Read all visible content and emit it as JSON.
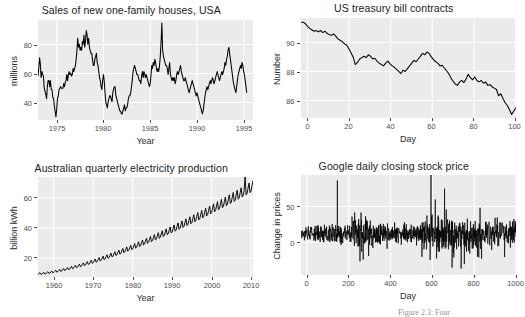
{
  "figure": {
    "caption": "Figure 2.3: Four",
    "panel_bg": "#ebebeb",
    "grid_color": "#ffffff",
    "line_color": "#000000"
  },
  "chart_data": [
    {
      "type": "line",
      "title": "Sales of new one-family houses, USA",
      "xlabel": "Year",
      "ylabel": "millions",
      "xticks": [
        1975,
        1980,
        1985,
        1990,
        1995
      ],
      "yticks": [
        40,
        60,
        80
      ],
      "xlim": [
        1973,
        1996
      ],
      "ylim": [
        26,
        92
      ],
      "grid": true,
      "x": [
        1973.0,
        1973.08,
        1973.17,
        1973.25,
        1973.33,
        1973.42,
        1973.5,
        1973.58,
        1973.67,
        1973.75,
        1973.83,
        1973.92,
        1974.0,
        1974.08,
        1974.17,
        1974.25,
        1974.33,
        1974.42,
        1974.5,
        1974.58,
        1974.67,
        1974.75,
        1974.83,
        1974.92,
        1975.0,
        1975.08,
        1975.17,
        1975.25,
        1975.33,
        1975.42,
        1975.5,
        1975.58,
        1975.67,
        1975.75,
        1975.83,
        1975.92,
        1976.0,
        1976.08,
        1976.17,
        1976.25,
        1976.33,
        1976.42,
        1976.5,
        1976.58,
        1976.67,
        1976.75,
        1976.83,
        1976.92,
        1977.0,
        1977.08,
        1977.17,
        1977.25,
        1977.33,
        1977.42,
        1977.5,
        1977.58,
        1977.67,
        1977.75,
        1977.83,
        1977.92,
        1978.0,
        1978.08,
        1978.17,
        1978.25,
        1978.33,
        1978.42,
        1978.5,
        1978.58,
        1978.67,
        1978.75,
        1978.83,
        1978.92,
        1979.0,
        1979.08,
        1979.17,
        1979.25,
        1979.33,
        1979.42,
        1979.5,
        1979.58,
        1979.67,
        1979.75,
        1979.83,
        1979.92,
        1980.0,
        1980.08,
        1980.17,
        1980.25,
        1980.33,
        1980.42,
        1980.5,
        1980.58,
        1980.67,
        1980.75,
        1980.83,
        1980.92,
        1981.0,
        1981.08,
        1981.17,
        1981.25,
        1981.33,
        1981.42,
        1981.5,
        1981.58,
        1981.67,
        1981.75,
        1981.83,
        1981.92,
        1982.0,
        1982.08,
        1982.17,
        1982.25,
        1982.33,
        1982.42,
        1982.5,
        1982.58,
        1982.67,
        1982.75,
        1982.83,
        1982.92,
        1983.0,
        1983.08,
        1983.17,
        1983.25,
        1983.33,
        1983.42,
        1983.5,
        1983.58,
        1983.67,
        1983.75,
        1983.83,
        1983.92,
        1984.0,
        1984.08,
        1984.17,
        1984.25,
        1984.33,
        1984.42,
        1984.5,
        1984.58,
        1984.67,
        1984.75,
        1984.83,
        1984.92,
        1985.0,
        1985.08,
        1985.17,
        1985.25,
        1985.33,
        1985.42,
        1985.5,
        1985.58,
        1985.67,
        1985.75,
        1985.83,
        1985.92,
        1986.0,
        1986.08,
        1986.17,
        1986.25,
        1986.33,
        1986.42,
        1986.5,
        1986.58,
        1986.67,
        1986.75,
        1986.83,
        1986.92,
        1987.0,
        1987.08,
        1987.17,
        1987.25,
        1987.33,
        1987.42,
        1987.5,
        1987.58,
        1987.67,
        1987.75,
        1987.83,
        1987.92,
        1988.0,
        1988.08,
        1988.17,
        1988.25,
        1988.33,
        1988.42,
        1988.5,
        1988.58,
        1988.67,
        1988.75,
        1988.83,
        1988.92,
        1989.0,
        1989.08,
        1989.17,
        1989.25,
        1989.33,
        1989.42,
        1989.5,
        1989.58,
        1989.67,
        1989.75,
        1989.83,
        1989.92,
        1990.0,
        1990.08,
        1990.17,
        1990.25,
        1990.33,
        1990.42,
        1990.5,
        1990.58,
        1990.67,
        1990.75,
        1990.83,
        1990.92,
        1991.0,
        1991.08,
        1991.17,
        1991.25,
        1991.33,
        1991.42,
        1991.5,
        1991.58,
        1991.67,
        1991.75,
        1991.83,
        1991.92,
        1992.0,
        1992.08,
        1992.17,
        1992.25,
        1992.33,
        1992.42,
        1992.5,
        1992.58,
        1992.67,
        1992.75,
        1992.83,
        1992.92,
        1993.0,
        1993.08,
        1993.17,
        1993.25,
        1993.33,
        1993.42,
        1993.5,
        1993.58,
        1993.67,
        1993.75,
        1993.83,
        1993.92,
        1994.0,
        1994.08,
        1994.17,
        1994.25,
        1994.33,
        1994.42,
        1994.5,
        1994.58,
        1994.67,
        1994.75,
        1994.83,
        1994.92,
        1995.0,
        1995.08,
        1995.17,
        1995.25,
        1995.33,
        1995.42,
        1995.5,
        1995.58,
        1995.67,
        1995.75
      ],
      "values": [
        55,
        60,
        67,
        63,
        54,
        58,
        56,
        55,
        47,
        45,
        43,
        40,
        48,
        52,
        52,
        48,
        52,
        46,
        46,
        41,
        40,
        35,
        32,
        28,
        33,
        40,
        42,
        46,
        47,
        48,
        47,
        47,
        47,
        50,
        48,
        51,
        52,
        56,
        52,
        56,
        58,
        56,
        57,
        55,
        56,
        60,
        58,
        60,
        62,
        66,
        72,
        80,
        74,
        76,
        72,
        74,
        72,
        78,
        76,
        82,
        74,
        78,
        85,
        82,
        76,
        80,
        74,
        72,
        70,
        70,
        66,
        62,
        62,
        66,
        68,
        70,
        64,
        62,
        58,
        54,
        52,
        48,
        46,
        52,
        56,
        52,
        44,
        38,
        36,
        34,
        38,
        40,
        42,
        42,
        40,
        38,
        44,
        46,
        48,
        48,
        42,
        40,
        38,
        36,
        34,
        32,
        32,
        30,
        30,
        32,
        34,
        36,
        32,
        34,
        34,
        36,
        40,
        42,
        42,
        44,
        48,
        52,
        58,
        60,
        62,
        60,
        58,
        56,
        56,
        54,
        52,
        52,
        50,
        55,
        58,
        54,
        58,
        56,
        54,
        56,
        54,
        52,
        50,
        48,
        50,
        55,
        62,
        60,
        64,
        62,
        66,
        64,
        60,
        58,
        60,
        58,
        62,
        68,
        78,
        90,
        72,
        68,
        66,
        64,
        62,
        62,
        60,
        56,
        60,
        64,
        56,
        54,
        52,
        54,
        52,
        54,
        50,
        52,
        56,
        58,
        56,
        58,
        60,
        62,
        58,
        56,
        54,
        52,
        52,
        54,
        52,
        50,
        48,
        46,
        44,
        46,
        48,
        50,
        52,
        50,
        48,
        46,
        44,
        42,
        44,
        42,
        40,
        38,
        36,
        34,
        32,
        30,
        32,
        36,
        40,
        44,
        46,
        48,
        46,
        48,
        50,
        52,
        50,
        52,
        54,
        52,
        50,
        52,
        54,
        56,
        58,
        56,
        54,
        52,
        54,
        56,
        58,
        56,
        58,
        60,
        64,
        62,
        66,
        68,
        72,
        74,
        70,
        66,
        62,
        58,
        54,
        50,
        48,
        46,
        44,
        48,
        52,
        56,
        58,
        60,
        62,
        60,
        64,
        62,
        58,
        56,
        52,
        48,
        44
      ]
    },
    {
      "type": "line",
      "title": "US treasury bill contracts",
      "xlabel": "Day",
      "ylabel": "Number",
      "xticks": [
        0,
        20,
        40,
        60,
        80,
        100
      ],
      "yticks": [
        86,
        88,
        90
      ],
      "xlim": [
        1,
        100
      ],
      "ylim": [
        84.6,
        91.8
      ],
      "grid": true,
      "x": [
        1,
        2,
        3,
        4,
        5,
        6,
        7,
        8,
        9,
        10,
        11,
        12,
        13,
        14,
        15,
        16,
        17,
        18,
        19,
        20,
        21,
        22,
        23,
        24,
        25,
        26,
        27,
        28,
        29,
        30,
        31,
        32,
        33,
        34,
        35,
        36,
        37,
        38,
        39,
        40,
        41,
        42,
        43,
        44,
        45,
        46,
        47,
        48,
        49,
        50,
        51,
        52,
        53,
        54,
        55,
        56,
        57,
        58,
        59,
        60,
        61,
        62,
        63,
        64,
        65,
        66,
        67,
        68,
        69,
        70,
        71,
        72,
        73,
        74,
        75,
        76,
        77,
        78,
        79,
        80,
        81,
        82,
        83,
        84,
        85,
        86,
        87,
        88,
        89,
        90,
        91,
        92,
        93,
        94,
        95,
        96,
        97,
        98,
        99,
        100
      ],
      "values": [
        91.5,
        91.5,
        91.4,
        91.2,
        91.05,
        90.95,
        90.85,
        90.9,
        90.8,
        90.9,
        90.75,
        90.85,
        90.7,
        90.6,
        90.55,
        90.65,
        90.5,
        90.3,
        90.2,
        90.1,
        89.95,
        89.85,
        89.6,
        89.3,
        89.0,
        88.45,
        88.6,
        88.85,
        88.95,
        89.05,
        88.95,
        89.15,
        89.05,
        88.85,
        88.9,
        88.7,
        88.55,
        88.45,
        88.35,
        88.55,
        88.7,
        88.5,
        88.35,
        88.25,
        88.1,
        87.95,
        87.8,
        88.05,
        87.95,
        88.15,
        88.35,
        88.55,
        88.75,
        88.65,
        88.85,
        89.05,
        89.25,
        89.15,
        89.35,
        89.25,
        89.0,
        88.8,
        88.65,
        88.55,
        88.35,
        88.4,
        88.2,
        88.0,
        87.8,
        87.5,
        87.25,
        87.05,
        86.95,
        87.2,
        87.3,
        87.15,
        87.4,
        87.75,
        87.5,
        87.35,
        87.55,
        87.3,
        87.2,
        87.3,
        87.1,
        87.2,
        86.95,
        87.0,
        86.85,
        86.75,
        86.65,
        86.2,
        86.35,
        86.0,
        85.7,
        85.5,
        85.2,
        84.85,
        85.1,
        85.35
      ]
    },
    {
      "type": "line",
      "title": "Australian quarterly electricity production",
      "xlabel": "Year",
      "ylabel": "billion kWh",
      "xticks": [
        1960,
        1970,
        1980,
        1990,
        2000,
        2010
      ],
      "yticks": [
        20,
        40,
        60
      ],
      "xlim": [
        1956,
        2010.5
      ],
      "ylim": [
        2,
        64
      ],
      "grid": true,
      "note": "quarterly series with strong seasonal sawtooth and upward trend; start approx 4 in 1956 rising to approx 58 in 2010 with a spike to 63 near 2008"
    },
    {
      "type": "line",
      "title": "Google daily closing stock price",
      "xlabel": "Day",
      "ylabel": "Change in prices",
      "xticks": [
        0,
        200,
        400,
        600,
        800,
        1000
      ],
      "yticks": [
        0,
        50
      ],
      "xlim": [
        1,
        1000
      ],
      "ylim": [
        -45,
        65
      ],
      "grid": true,
      "note": "daily differenced series, mean near 0, volatility clusters; positive spikes near day 170 (+59), day 605 (+93), day 668 (+50); negative spikes near day 745 (-38) and day 840 (-27)"
    }
  ]
}
